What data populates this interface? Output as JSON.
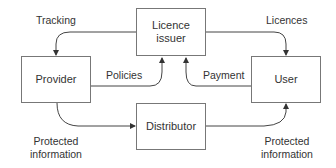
{
  "diagram": {
    "nodes": {
      "licence_issuer": {
        "line1": "Licence",
        "line2": "issuer"
      },
      "provider": {
        "label": "Provider"
      },
      "user": {
        "label": "User"
      },
      "distributor": {
        "label": "Distributor"
      }
    },
    "edges": {
      "tracking": {
        "label": "Tracking",
        "from": "Licence issuer",
        "to": "Provider"
      },
      "licences": {
        "label": "Licences",
        "from": "Licence issuer",
        "to": "User"
      },
      "policies": {
        "label": "Policies",
        "from": "Provider",
        "to": "Licence issuer"
      },
      "payment": {
        "label": "Payment",
        "from": "User",
        "to": "Licence issuer"
      },
      "protected_provider": {
        "line1": "Protected",
        "line2": "information",
        "from": "Provider",
        "to": "Distributor"
      },
      "protected_user": {
        "line1": "Protected",
        "line2": "information",
        "from": "Distributor",
        "to": "User"
      }
    }
  }
}
